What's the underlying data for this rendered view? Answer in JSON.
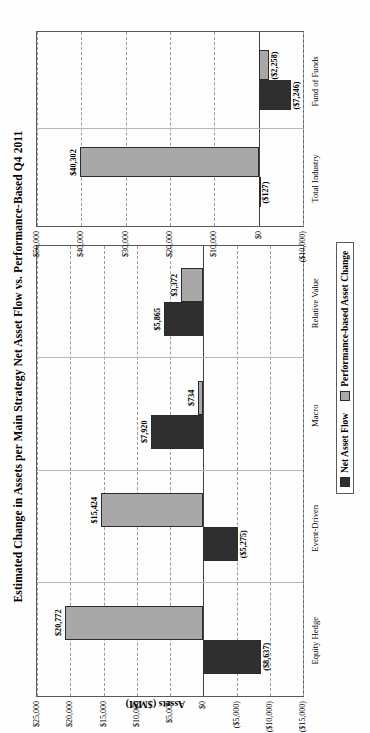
{
  "chart_data": {
    "type": "bar",
    "title": "Estimated Change in Assets per Main Strategy Net Asset Flow vs. Performance-Based Q4 2011",
    "xlabel": "",
    "ylabel": "Assets ($MM)",
    "orientation": "vertical-grouped",
    "grid": true,
    "legend_position": "bottom-center",
    "legend": [
      "Net Asset Flow",
      "Performance-based Asset Change"
    ],
    "colors": {
      "net_asset_flow": "#2f2f2f",
      "performance_based": "#a8a8a8",
      "gridline": "#9a9a9a",
      "axis": "#5a5a5a"
    },
    "panels": [
      {
        "name": "main-strategies",
        "categories": [
          "Equity Hedge",
          "Event-Driven",
          "Macro",
          "Relative Value"
        ],
        "ylim": [
          -15000,
          25000
        ],
        "yticks": [
          25000,
          20000,
          15000,
          10000,
          5000,
          0,
          -5000,
          -10000,
          -15000
        ],
        "ytick_labels": [
          "$25,000",
          "$20,000",
          "$15,000",
          "$10,000",
          "$5,000",
          "$0",
          "($5,000)",
          "($10,000)",
          "($15,000)"
        ],
        "series": [
          {
            "name": "Net Asset Flow",
            "values": [
              -8637,
              -5275,
              7920,
              5865
            ],
            "labels": [
              "($8,637)",
              "($5,275)",
              "$7,920",
              "$5,865"
            ]
          },
          {
            "name": "Performance-based Asset Change",
            "values": [
              20772,
              15424,
              734,
              3372
            ],
            "labels": [
              "$20,772",
              "$15,424",
              "$734",
              "$3,372"
            ]
          }
        ]
      },
      {
        "name": "totals",
        "categories": [
          "Total Industry",
          "Fund of Funds"
        ],
        "ylim": [
          -10000,
          50000
        ],
        "yticks": [
          50000,
          40000,
          30000,
          20000,
          10000,
          0,
          -10000
        ],
        "ytick_labels": [
          "$50,000",
          "$40,000",
          "$30,000",
          "$20,000",
          "$10,000",
          "$0",
          "($10,000)"
        ],
        "series": [
          {
            "name": "Net Asset Flow",
            "values": [
              -127,
              -7246
            ],
            "labels": [
              "($127)",
              "($7,246)"
            ]
          },
          {
            "name": "Performance-based Asset Change",
            "values": [
              40302,
              -2258
            ],
            "labels": [
              "$40,302",
              "($2,258)"
            ]
          }
        ]
      }
    ]
  },
  "page": {
    "number": ""
  }
}
